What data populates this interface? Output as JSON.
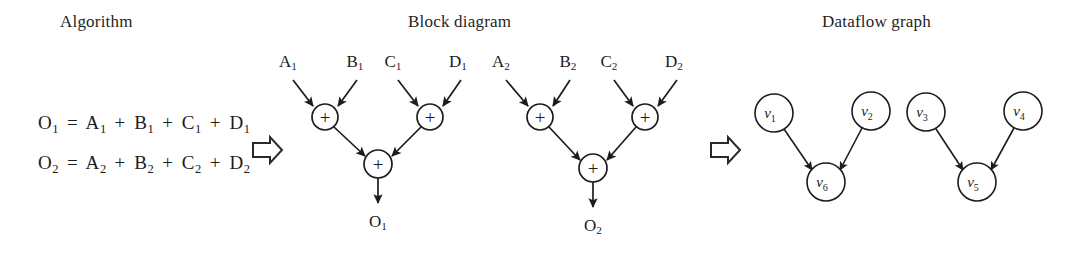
{
  "figure": {
    "width": 1075,
    "height": 259,
    "background": "#ffffff",
    "stroke_color": "#1c1c1c",
    "text_color": "#1c1c1c"
  },
  "panels": {
    "algorithm": {
      "heading": "Algorithm"
    },
    "block_diagram": {
      "heading": "Block diagram"
    },
    "dataflow_graph": {
      "heading": "Dataflow graph"
    }
  },
  "algorithm": {
    "equations": [
      {
        "output": "O",
        "output_sub": "1",
        "equals": "=",
        "terms": [
          {
            "name": "A",
            "sub": "1"
          },
          {
            "name": "B",
            "sub": "1"
          },
          {
            "name": "C",
            "sub": "1"
          },
          {
            "name": "D",
            "sub": "1"
          }
        ],
        "operator": "+",
        "text": "O1 = A1 + B1 + C1 + D1"
      },
      {
        "output": "O",
        "output_sub": "2",
        "equals": "=",
        "terms": [
          {
            "name": "A",
            "sub": "2"
          },
          {
            "name": "B",
            "sub": "2"
          },
          {
            "name": "C",
            "sub": "2"
          },
          {
            "name": "D",
            "sub": "2"
          }
        ],
        "operator": "+",
        "text": "O2 = A2 + B2 + C2 + D2"
      }
    ]
  },
  "transform_arrows": [
    {
      "name": "arrow-algorithm-to-block",
      "x": 252,
      "y": 137,
      "glyph": "block-right-arrow-icon"
    },
    {
      "name": "arrow-block-to-dataflow",
      "x": 710,
      "y": 137,
      "glyph": "block-right-arrow-icon"
    }
  ],
  "block_diagram": {
    "operator_symbol": "+",
    "inputs": [
      {
        "label": "A",
        "sub": "1",
        "x": 288,
        "y": 62
      },
      {
        "label": "B",
        "sub": "1",
        "x": 355,
        "y": 62
      },
      {
        "label": "C",
        "sub": "1",
        "x": 393,
        "y": 62
      },
      {
        "label": "D",
        "sub": "1",
        "x": 458,
        "y": 62
      },
      {
        "label": "A",
        "sub": "2",
        "x": 501,
        "y": 62
      },
      {
        "label": "B",
        "sub": "2",
        "x": 568,
        "y": 62
      },
      {
        "label": "C",
        "sub": "2",
        "x": 609,
        "y": 62
      },
      {
        "label": "D",
        "sub": "2",
        "x": 674,
        "y": 62
      }
    ],
    "adders": [
      {
        "id": "adder-1",
        "cx": 325,
        "cy": 117,
        "r": 13
      },
      {
        "id": "adder-2",
        "cx": 430,
        "cy": 117,
        "r": 13
      },
      {
        "id": "adder-3",
        "cx": 378,
        "cy": 164,
        "r": 14
      },
      {
        "id": "adder-4",
        "cx": 540,
        "cy": 117,
        "r": 13
      },
      {
        "id": "adder-5",
        "cx": 645,
        "cy": 117,
        "r": 13
      },
      {
        "id": "adder-6",
        "cx": 593,
        "cy": 168,
        "r": 14
      }
    ],
    "outputs": [
      {
        "label": "O",
        "sub": "1",
        "x": 378,
        "y": 222
      },
      {
        "label": "O",
        "sub": "2",
        "x": 593,
        "y": 226
      }
    ],
    "edges": [
      {
        "from": "A1",
        "to": "adder-1"
      },
      {
        "from": "B1",
        "to": "adder-1"
      },
      {
        "from": "C1",
        "to": "adder-2"
      },
      {
        "from": "D1",
        "to": "adder-2"
      },
      {
        "from": "adder-1",
        "to": "adder-3"
      },
      {
        "from": "adder-2",
        "to": "adder-3"
      },
      {
        "from": "adder-3",
        "to": "O1"
      },
      {
        "from": "A2",
        "to": "adder-4"
      },
      {
        "from": "B2",
        "to": "adder-4"
      },
      {
        "from": "C2",
        "to": "adder-5"
      },
      {
        "from": "D2",
        "to": "adder-5"
      },
      {
        "from": "adder-4",
        "to": "adder-6"
      },
      {
        "from": "adder-5",
        "to": "adder-6"
      },
      {
        "from": "adder-6",
        "to": "O2"
      }
    ]
  },
  "dataflow_graph": {
    "nodes": [
      {
        "id": "v1",
        "label": "v",
        "sub": "1",
        "cx": 774,
        "cy": 113,
        "r": 19
      },
      {
        "id": "v2",
        "label": "v",
        "sub": "2",
        "cx": 871,
        "cy": 111,
        "r": 19
      },
      {
        "id": "v3",
        "label": "v",
        "sub": "3",
        "cx": 926,
        "cy": 112,
        "r": 19
      },
      {
        "id": "v4",
        "label": "v",
        "sub": "4",
        "cx": 1023,
        "cy": 111,
        "r": 19
      },
      {
        "id": "v6",
        "label": "v",
        "sub": "6",
        "cx": 826,
        "cy": 182,
        "r": 19
      },
      {
        "id": "v5",
        "label": "v",
        "sub": "5",
        "cx": 977,
        "cy": 182,
        "r": 19
      }
    ],
    "edges": [
      {
        "from": "v1",
        "to": "v6"
      },
      {
        "from": "v2",
        "to": "v6"
      },
      {
        "from": "v3",
        "to": "v5"
      },
      {
        "from": "v4",
        "to": "v5"
      }
    ]
  }
}
